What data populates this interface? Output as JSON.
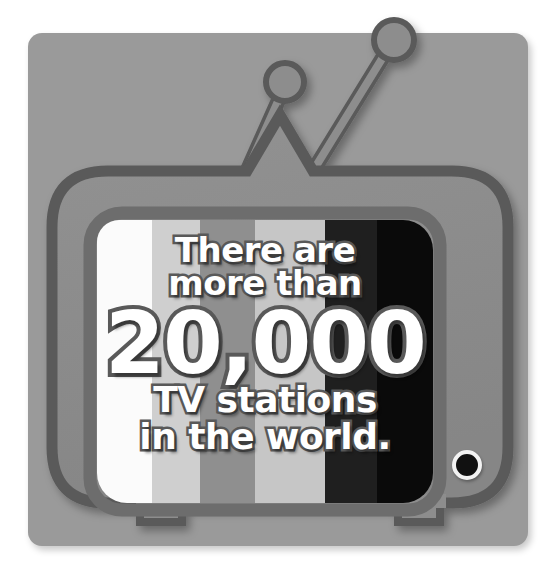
{
  "poster": {
    "caption_lines": [
      "There are",
      "more than",
      "20,000",
      "TV stations",
      "in the world."
    ],
    "headline_number": "20,000",
    "subject": "TV stations",
    "scope": "in the world.",
    "qualifier": "There are more than",
    "alt_text": "Retro television set illustration with color test bars and the text: There are more than 20,000 TV stations in the world."
  },
  "colors": {
    "page_background": "#ffffff",
    "panel_background": "#9a9a9a",
    "tv_body": "#8d8d8d",
    "tv_outline": "#5a5a5a",
    "screen_bezel": "#6d6d6d",
    "text_fill": "#ffffff",
    "text_outline": "#595959",
    "knob_fill": "#111111",
    "knob_ring": "#f2f2f2"
  },
  "screen_bars": [
    {
      "name": "bar-white",
      "color": "#fbfbfb",
      "left": 0,
      "width": 55
    },
    {
      "name": "bar-light-gray",
      "color": "#cfcfcf",
      "left": 55,
      "width": 48
    },
    {
      "name": "bar-mid-gray",
      "color": "#8f8f8f",
      "left": 103,
      "width": 55
    },
    {
      "name": "bar-light-gray-2",
      "color": "#c6c6c6",
      "left": 158,
      "width": 70
    },
    {
      "name": "bar-near-black",
      "color": "#1f1f1f",
      "left": 228,
      "width": 52
    },
    {
      "name": "bar-black",
      "color": "#0a0a0a",
      "left": 280,
      "width": 56
    }
  ],
  "parts": {
    "antenna_left": "antenna-left",
    "antenna_right": "antenna-right",
    "foot_left": "foot-left",
    "foot_right": "foot-right",
    "tuning_knob": "tuning-knob"
  }
}
